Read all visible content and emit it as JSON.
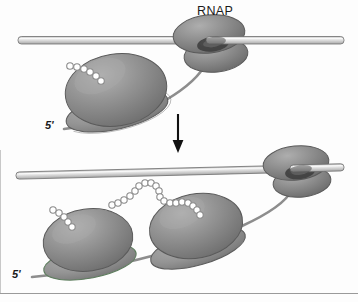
{
  "figure": {
    "background_color": "#fdfdfd",
    "width": 358,
    "height": 302,
    "border_rule_color": "#9a9a9a"
  },
  "palette": {
    "dna_fill": "#d8d8d8",
    "dna_highlight": "#f2f2f2",
    "dna_outline": "#6e6e6e",
    "ribosome_large_fill": "#8d8d8d",
    "ribosome_large_highlight": "#a8a8a8",
    "ribosome_small_fill": "#9a9a9a",
    "ribosome_outline": "#5a5a5a",
    "rnap_fill": "#8a8a8a",
    "rnap_highlight": "#a4a4a4",
    "rnap_channel_dark": "#4a4a4a",
    "mrna_stroke": "#8a8a8a",
    "bead_fill": "#ffffff",
    "bead_outline": "#8a8a8a",
    "arrow_color": "#111111",
    "label_color": "#1a1a1a"
  },
  "labels": {
    "rnap": "RNAP",
    "five_prime_top": "5'",
    "five_prime_bottom": "5'"
  },
  "panels": [
    {
      "name": "top-panel",
      "description": "Single ribosome translating nascent mRNA while RNAP transcribes DNA",
      "dna": {
        "x1": 18,
        "y1": 40,
        "x2": 344,
        "y2": 40,
        "thickness": 7
      },
      "rnap": {
        "cx": 211,
        "cy": 45,
        "label": "RNAP"
      },
      "ribosomes": 1,
      "polypeptide_beads": 6,
      "mrna_label": "5'"
    },
    {
      "name": "bottom-panel",
      "description": "RNAP advanced along DNA with two ribosomes on the elongated mRNA",
      "dna": {
        "x1": 16,
        "y1": 176,
        "x2": 344,
        "y2": 168,
        "thickness": 7
      },
      "rnap": {
        "cx": 297,
        "cy": 172
      },
      "ribosomes": 2,
      "polypeptide_beads": 19,
      "mrna_label": "5'"
    }
  ],
  "arrow": {
    "name": "progression-arrow",
    "direction": "down",
    "x": 178,
    "y_start": 114,
    "y_end": 152
  }
}
